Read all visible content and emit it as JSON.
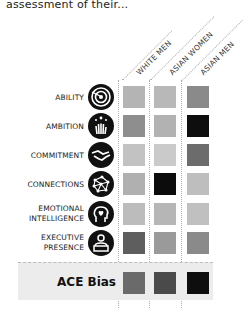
{
  "intro_text": "assessment of their...",
  "columns": [
    {
      "label": "WHITE MEN"
    },
    {
      "label": "ASIAN WOMEN"
    },
    {
      "label": "ASIAN MEN"
    }
  ],
  "rows": [
    {
      "label": "ABILITY",
      "icon": "target-icon",
      "shades": [
        "#b4b4b4",
        "#b8b8b8",
        "#8a8a8a"
      ]
    },
    {
      "label": "AMBITION",
      "icon": "reaching-hand-stars-icon",
      "shades": [
        "#8e8e8e",
        "#b2b2b2",
        "#0e0e0e"
      ]
    },
    {
      "label": "COMMITMENT",
      "icon": "handshake-icon",
      "shades": [
        "#c2c2c2",
        "#cacaca",
        "#6c6c6c"
      ]
    },
    {
      "label": "CONNECTIONS",
      "icon": "network-icon",
      "shades": [
        "#b0b0b0",
        "#0c0c0c",
        "#bebebe"
      ]
    },
    {
      "label_line1": "EMOTIONAL",
      "label_line2": "INTELLIGENCE",
      "icon": "head-heart-icon",
      "shades": [
        "#bcbcbc",
        "#b6b6b6",
        "#c0c0c0"
      ]
    },
    {
      "label_line1": "EXECUTIVE",
      "label_line2": "PRESENCE",
      "icon": "person-podium-icon",
      "shades": [
        "#5e5e5e",
        "#9a9a9a",
        "#8a8a8a"
      ]
    }
  ],
  "summary_row": {
    "label": "ACE Bias",
    "shades": [
      "#6a6a6a",
      "#4a4a4a",
      "#0e0e0e"
    ]
  }
}
